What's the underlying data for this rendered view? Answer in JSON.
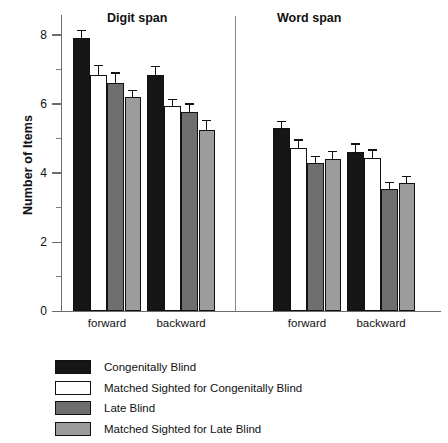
{
  "chart_data": {
    "type": "bar",
    "title": "",
    "xlabel": "",
    "ylabel": "Number of Items",
    "ylim": [
      0,
      8.58
    ],
    "yticks_major": [
      0,
      2,
      4,
      6,
      8
    ],
    "yticks_minor": [
      1,
      3,
      5,
      7
    ],
    "grid": false,
    "legend_position": "below-plot",
    "panels": [
      {
        "name": "Digit span",
        "categories": [
          "forward",
          "backward"
        ]
      },
      {
        "name": "Word span",
        "categories": [
          "forward",
          "backward"
        ]
      }
    ],
    "categories": [
      "Digit span forward",
      "Digit span backward",
      "Word span forward",
      "Word span backward"
    ],
    "series": [
      {
        "name": "Congenitally Blind",
        "color": "#161616",
        "values": [
          7.9,
          6.85,
          5.3,
          4.6
        ],
        "errors": [
          0.25,
          0.25,
          0.22,
          0.26
        ]
      },
      {
        "name": "Matched Sighted for Congenitally Blind",
        "color": "#ffffff",
        "values": [
          6.85,
          5.95,
          4.72,
          4.45
        ],
        "errors": [
          0.28,
          0.2,
          0.26,
          0.24
        ]
      },
      {
        "name": "Late Blind",
        "color": "#6e6e6e",
        "values": [
          6.62,
          5.78,
          4.3,
          3.55
        ],
        "errors": [
          0.3,
          0.24,
          0.2,
          0.2
        ]
      },
      {
        "name": "Matched Sighted for Late Blind",
        "color": "#9c9c9c",
        "values": [
          6.2,
          5.25,
          4.42,
          3.7
        ],
        "errors": [
          0.2,
          0.3,
          0.22,
          0.22
        ]
      }
    ]
  },
  "axis": {
    "y_label": "Number of Items",
    "tick_labels": [
      "8",
      "6",
      "4",
      "2",
      "0"
    ]
  },
  "panels": {
    "digit": {
      "title": "Digit span",
      "forward": "forward",
      "backward": "backward"
    },
    "word": {
      "title": "Word span",
      "forward": "forward",
      "backward": "backward"
    }
  },
  "legend": {
    "items": [
      {
        "label": "Congenitally Blind",
        "color": "#161616"
      },
      {
        "label": "Matched Sighted for Congenitally Blind",
        "color": "#ffffff"
      },
      {
        "label": "Late Blind",
        "color": "#6e6e6e"
      },
      {
        "label": "Matched Sighted for Late Blind",
        "color": "#9c9c9c"
      }
    ]
  }
}
